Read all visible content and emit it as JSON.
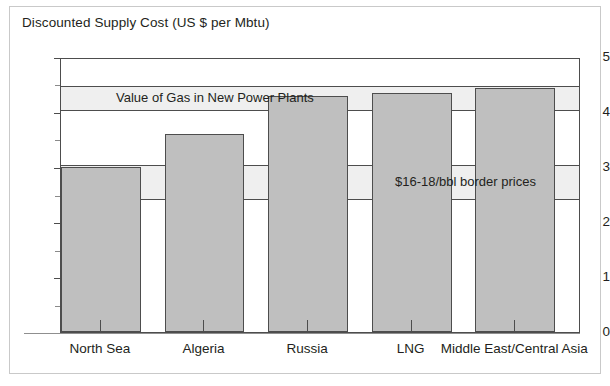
{
  "chart_data": {
    "type": "bar",
    "title": "Discounted Supply Cost (US $ per Mbtu)",
    "xlabel": "",
    "ylabel": "Discounted Supply Cost (US $ per Mbtu)",
    "categories": [
      "North Sea",
      "Algeria",
      "Russia",
      "LNG",
      "Middle East/Central Asia"
    ],
    "values": [
      3.02,
      3.63,
      4.32,
      4.37,
      4.47
    ],
    "ylim": [
      0,
      5
    ],
    "yticks": [
      0,
      1,
      2,
      3,
      4,
      5
    ],
    "ytick_labels": [
      "0",
      "1",
      "2",
      "3",
      "4",
      "5"
    ],
    "yticks_minor": [
      0.5,
      1.5,
      2.5,
      3.5,
      4.5
    ],
    "grid": false,
    "legend": "none",
    "bar_color": "#bfbfbf",
    "bar_edge_color": "#4d4d4d",
    "band_color": "#efefef",
    "annotations": [
      {
        "name": "value-of-gas-band",
        "label": "Value of Gas in New Power Plants",
        "y_from": 4.05,
        "y_to": 4.5
      },
      {
        "name": "border-prices-band",
        "label": "$16-18/bbl border prices",
        "y_from": 2.42,
        "y_to": 3.05
      }
    ]
  },
  "figure": {
    "title": "Discounted Supply Cost (US $ per Mbtu)",
    "frame_color": "#c9c9c9",
    "background": "#ffffff"
  },
  "axis": {
    "y_labels": [
      "5",
      "4",
      "3",
      "2",
      "1",
      "0"
    ],
    "x_labels": [
      "North Sea",
      "Algeria",
      "Russia",
      "LNG",
      "Middle East/Central Asia"
    ]
  },
  "bands": {
    "upper_label": "Value of Gas in New Power Plants",
    "lower_label": "$16-18/bbl border prices"
  }
}
